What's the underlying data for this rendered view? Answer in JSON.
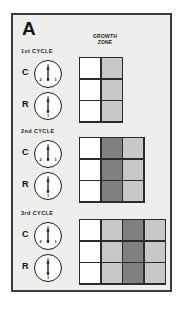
{
  "figure": {
    "panel_letter": "A",
    "background_color": "#eeeeec",
    "border_color": "#3b3b3b",
    "growth_zone_heading": {
      "line1": "GROWTH",
      "line2": "ZONE"
    }
  },
  "colors": {
    "white_cell": "#ffffff",
    "light_gray_cell": "#c8c8c8",
    "dark_gray_cell": "#808080",
    "grid_line": "#2b2b2b",
    "text": "#141414"
  },
  "cycles": [
    {
      "title": "1st  CYCLE",
      "rows": [
        {
          "label": "C",
          "dial": {
            "name": "c-dial",
            "arrow": "double-headed-vertical",
            "numbers": {
              "top": "0",
              "left": "2",
              "right": "1"
            }
          }
        },
        {
          "label": "R",
          "dial": {
            "name": "r-dial",
            "arrow": "double-headed-vertical",
            "numbers": {
              "top": "0",
              "bottom": "1"
            }
          }
        }
      ],
      "grid": {
        "columns": 2,
        "rows": 3,
        "cells": [
          [
            "#ffffff",
            "#c8c8c8"
          ],
          [
            "#ffffff",
            "#c8c8c8"
          ],
          [
            "#ffffff",
            "#c8c8c8"
          ]
        ]
      }
    },
    {
      "title": "2nd  CYCLE",
      "rows": [
        {
          "label": "C",
          "dial": {
            "name": "c-dial",
            "arrow": "double-headed-vertical",
            "numbers": {
              "top": "0",
              "left": "2",
              "right": "1"
            }
          }
        },
        {
          "label": "R",
          "dial": {
            "name": "r-dial",
            "arrow": "double-headed-vertical",
            "numbers": {
              "top": "0",
              "bottom": "1"
            }
          }
        }
      ],
      "grid": {
        "columns": 3,
        "rows": 3,
        "cells": [
          [
            "#ffffff",
            "#808080",
            "#c8c8c8"
          ],
          [
            "#ffffff",
            "#808080",
            "#c8c8c8"
          ],
          [
            "#ffffff",
            "#808080",
            "#c8c8c8"
          ]
        ]
      }
    },
    {
      "title": "3rd  CYCLE",
      "rows": [
        {
          "label": "C",
          "dial": {
            "name": "c-dial",
            "arrow": "double-headed-vertical",
            "numbers": {
              "top": "0",
              "left": "2",
              "right": "1"
            }
          }
        },
        {
          "label": "R",
          "dial": {
            "name": "r-dial",
            "arrow": "double-headed-vertical",
            "numbers": {
              "top": "0",
              "bottom": "1"
            }
          }
        }
      ],
      "grid": {
        "columns": 4,
        "rows": 3,
        "cells": [
          [
            "#ffffff",
            "#c8c8c8",
            "#808080",
            "#c8c8c8"
          ],
          [
            "#ffffff",
            "#c8c8c8",
            "#808080",
            "#c8c8c8"
          ],
          [
            "#ffffff",
            "#c8c8c8",
            "#808080",
            "#c8c8c8"
          ]
        ]
      }
    }
  ]
}
